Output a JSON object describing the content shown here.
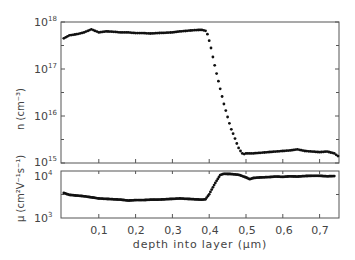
{
  "chart_data": [
    {
      "type": "scatter",
      "panel": "top",
      "title": "",
      "xlabel": "depth into layer (µm)",
      "ylabel": "n (cm⁻³)",
      "yscale": "log",
      "ylim": [
        1000000000000000.0,
        1e+18
      ],
      "xlim": [
        0,
        0.755
      ],
      "y_tick_labels": [
        "10¹⁵",
        "10¹⁶",
        "10¹⁷",
        "10¹⁸"
      ],
      "series": [
        {
          "name": "carrier concentration",
          "x": [
            0.005,
            0.02,
            0.04,
            0.06,
            0.08,
            0.1,
            0.12,
            0.14,
            0.16,
            0.18,
            0.2,
            0.22,
            0.24,
            0.26,
            0.28,
            0.3,
            0.32,
            0.34,
            0.36,
            0.38,
            0.39,
            0.395,
            0.4,
            0.405,
            0.41,
            0.415,
            0.42,
            0.425,
            0.43,
            0.435,
            0.44,
            0.445,
            0.45,
            0.455,
            0.46,
            0.465,
            0.47,
            0.475,
            0.48,
            0.485,
            0.49,
            0.495,
            0.5,
            0.52,
            0.54,
            0.56,
            0.58,
            0.6,
            0.62,
            0.64,
            0.66,
            0.68,
            0.7,
            0.72,
            0.74,
            0.75
          ],
          "y": [
            4.5e+17,
            5.2e+17,
            5.5e+17,
            6e+17,
            7e+17,
            6e+17,
            6.3e+17,
            6.2e+17,
            6e+17,
            6e+17,
            5.8e+17,
            5.8e+17,
            5.7e+17,
            5.8e+17,
            5.9e+17,
            6e+17,
            6.3e+17,
            6.5e+17,
            6.7e+17,
            6.8e+17,
            6.5e+17,
            5.5e+17,
            4e+17,
            2.8e+17,
            1.8e+17,
            1.2e+17,
            8e+16,
            5.5e+16,
            3.8e+16,
            2.6e+16,
            1.8e+16,
            1.3e+16,
            9500000000000000.0,
            7000000000000000.0,
            5200000000000000.0,
            4200000000000000.0,
            3300000000000000.0,
            2600000000000000.0,
            2100000000000000.0,
            1800000000000000.0,
            1600000000000000.0,
            1550000000000000.0,
            1600000000000000.0,
            1600000000000000.0,
            1650000000000000.0,
            1700000000000000.0,
            1750000000000000.0,
            1800000000000000.0,
            1850000000000000.0,
            1950000000000000.0,
            1800000000000000.0,
            1750000000000000.0,
            1700000000000000.0,
            1750000000000000.0,
            1600000000000000.0,
            1400000000000000.0
          ]
        }
      ]
    },
    {
      "type": "scatter",
      "panel": "bottom",
      "title": "",
      "xlabel": "depth into layer (µm)",
      "ylabel": "µ (cm²V⁻¹s⁻¹)",
      "yscale": "log",
      "ylim": [
        1000,
        10000
      ],
      "xlim": [
        0,
        0.755
      ],
      "x_tick_labels": [
        "0,1",
        "0,2",
        "0,3",
        "0,4",
        "0,5",
        "0,6",
        "0,7"
      ],
      "x_ticks": [
        0.1,
        0.2,
        0.3,
        0.4,
        0.5,
        0.6,
        0.7
      ],
      "y_tick_labels": [
        "10³",
        "10⁴"
      ],
      "series": [
        {
          "name": "mobility",
          "x": [
            0.005,
            0.02,
            0.04,
            0.06,
            0.08,
            0.1,
            0.12,
            0.14,
            0.16,
            0.18,
            0.2,
            0.22,
            0.24,
            0.26,
            0.28,
            0.3,
            0.32,
            0.34,
            0.36,
            0.38,
            0.39,
            0.4,
            0.41,
            0.42,
            0.43,
            0.44,
            0.46,
            0.48,
            0.5,
            0.51,
            0.52,
            0.54,
            0.56,
            0.58,
            0.6,
            0.62,
            0.64,
            0.66,
            0.68,
            0.7,
            0.72,
            0.74
          ],
          "y": [
            3400,
            3100,
            3000,
            2900,
            2750,
            2600,
            2550,
            2500,
            2450,
            2350,
            2400,
            2400,
            2450,
            2450,
            2500,
            2550,
            2600,
            2550,
            2500,
            2450,
            2500,
            3200,
            4500,
            6200,
            8200,
            8700,
            8600,
            8300,
            7300,
            6700,
            7100,
            7300,
            7400,
            7600,
            7500,
            7700,
            7600,
            7800,
            7900,
            7900,
            7700,
            7800
          ]
        }
      ]
    }
  ],
  "labels": {
    "y_top": "n (cm⁻³)",
    "y_bottom": "µ (cm²V⁻¹s⁻¹)",
    "x_axis": "depth into layer (µm)",
    "top_ticks": [
      "10",
      "10",
      "10",
      "10"
    ],
    "top_exps": [
      "18",
      "17",
      "16",
      "15"
    ],
    "bottom_ticks": [
      "10",
      "10"
    ],
    "bottom_exps": [
      "4",
      "3"
    ],
    "x_ticks": [
      "0,1",
      "0,2",
      "0,3",
      "0,4",
      "0,5",
      "0,6",
      "0,7"
    ]
  }
}
